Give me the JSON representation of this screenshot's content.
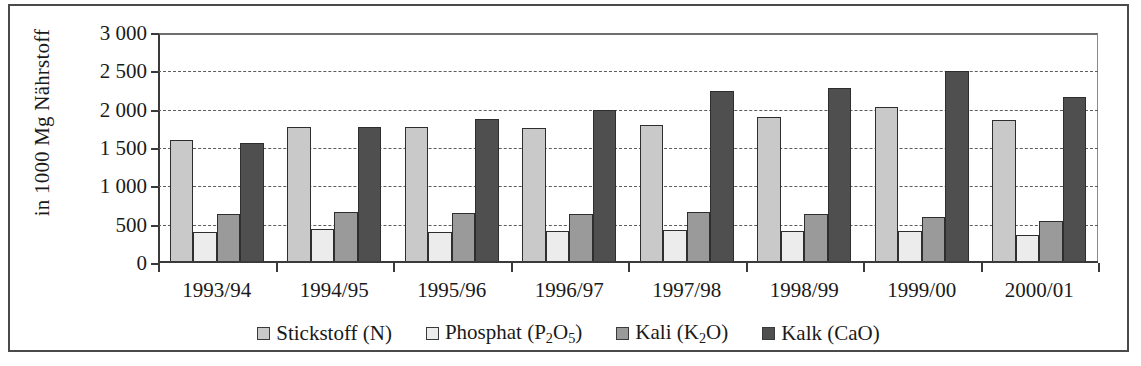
{
  "chart_data": {
    "type": "bar",
    "title": "",
    "xlabel": "",
    "ylabel": "in 1000 Mg Nährstoff",
    "ylim": [
      0,
      3000
    ],
    "ytick_labels": [
      "3 000",
      "2 500",
      "2 000",
      "1 500",
      "1 000",
      "500",
      "0"
    ],
    "ytick_values": [
      3000,
      2500,
      2000,
      1500,
      1000,
      500,
      0
    ],
    "grid": true,
    "legend_position": "bottom",
    "categories": [
      "1993/94",
      "1994/95",
      "1995/96",
      "1996/97",
      "1997/98",
      "1998/99",
      "1999/00",
      "2000/01"
    ],
    "series": [
      {
        "name": "Stickstoff (N)",
        "color": "#c9c9c9",
        "values": [
          1610,
          1780,
          1770,
          1760,
          1800,
          1910,
          2030,
          1860
        ]
      },
      {
        "name": "Phosphat (P2O5)",
        "color": "#ececec",
        "values": [
          410,
          450,
          400,
          420,
          430,
          420,
          420,
          360
        ]
      },
      {
        "name": "Kali (K2O)",
        "color": "#9a9a9a",
        "values": [
          640,
          670,
          655,
          640,
          665,
          640,
          605,
          550
        ]
      },
      {
        "name": "Kalk (CaO)",
        "color": "#4f4f4f",
        "values": [
          1560,
          1770,
          1880,
          1990,
          2250,
          2280,
          2510,
          2170
        ]
      }
    ]
  },
  "legend": {
    "items": [
      {
        "label_html": "Stickstoff (N)",
        "name": "legend-stickstoff"
      },
      {
        "label_html": "Phosphat (P<sub>2</sub>O<sub>5</sub>)",
        "name": "legend-phosphat"
      },
      {
        "label_html": "Kali (K<sub>2</sub>O)",
        "name": "legend-kali"
      },
      {
        "label_html": "Kalk (CaO)",
        "name": "legend-kalk"
      }
    ]
  }
}
